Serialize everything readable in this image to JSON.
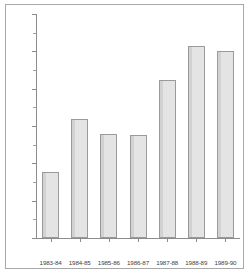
{
  "chart_data": {
    "type": "bar",
    "title": "",
    "subtitle": "",
    "xlabel": "",
    "ylabel": "",
    "categories": [
      "1983-84",
      "1984-85",
      "1985-86",
      "1986-87",
      "1987-88",
      "1988-89",
      "1989-90"
    ],
    "values": [
      880,
      1600,
      1395,
      1380,
      2120,
      2570,
      2510
    ],
    "series": [
      {
        "name": "",
        "values": [
          880,
          1600,
          1395,
          1380,
          2120,
          2570,
          2510
        ]
      }
    ],
    "ylim": [
      0,
      3000
    ],
    "y_major_ticks": [
      0,
      500,
      1000,
      1500,
      2000,
      2500,
      3000
    ],
    "y_tick_labels": [
      "0",
      "500",
      "1000",
      "1500",
      "2000",
      "2500",
      "3000"
    ],
    "y_minor_ticks": [
      250,
      750,
      1250,
      1750,
      2250,
      2750
    ],
    "grid": false,
    "legend": null,
    "legend_position": "none",
    "annotations": [],
    "bar_fill_color": "#e4e4e4",
    "bar_edge_color": "#9a9a9a",
    "axis_color": "#8c8c8c",
    "background_color": "#ffffff"
  }
}
